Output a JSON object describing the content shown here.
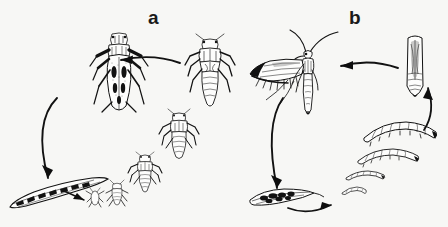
{
  "figure": {
    "background_color": "#f7f7f5",
    "ink_color": "#121212",
    "width": 448,
    "height": 227,
    "style": "black-and-white line drawing"
  },
  "panels": [
    {
      "id": "a",
      "label": "a",
      "label_position": {
        "x": 148,
        "y": 8
      },
      "subject": "leafhopper life cycle",
      "cycle_direction": "counter-clockwise",
      "stages": [
        {
          "name": "adult",
          "order": 5,
          "data_name": "leafhopper-adult",
          "description": "winged adult leafhopper, dorsal view, dark markings on forewings",
          "position": {
            "x": 88,
            "y": 75
          },
          "size": {
            "w": 62,
            "h": 86
          }
        },
        {
          "name": "fifth-instar-nymph",
          "order": 4,
          "data_name": "leafhopper-nymph-5",
          "description": "largest nymph with wing pads",
          "position": {
            "x": 203,
            "y": 72
          },
          "size": {
            "w": 52,
            "h": 78
          }
        },
        {
          "name": "fourth-instar-nymph",
          "order": 3,
          "data_name": "leafhopper-nymph-4",
          "description": "medium nymph",
          "position": {
            "x": 173,
            "y": 128
          },
          "size": {
            "w": 40,
            "h": 58
          }
        },
        {
          "name": "third-instar-nymph",
          "order": 2,
          "data_name": "leafhopper-nymph-3",
          "description": "small nymph",
          "position": {
            "x": 143,
            "y": 170
          },
          "size": {
            "w": 33,
            "h": 48
          }
        },
        {
          "name": "first-instar-nymph",
          "order": 1,
          "data_name": "leafhopper-nymph-1",
          "description": "tiny newly hatched nymphs",
          "position": {
            "x": 112,
            "y": 192
          },
          "size": {
            "w": 22,
            "h": 26
          }
        },
        {
          "name": "eggs-in-plant-tissue",
          "order": 0,
          "data_name": "leafhopper-eggs",
          "description": "eggs inserted in a leaf midrib / stem, curved blade shape",
          "position": {
            "x": 10,
            "y": 178
          },
          "size": {
            "w": 100,
            "h": 36
          }
        }
      ],
      "arrows": [
        {
          "data_name": "arrow-nymph-to-adult",
          "from": "fifth-instar-nymph",
          "to": "adult",
          "direction": "leftward",
          "curve": "arc-up"
        },
        {
          "data_name": "arrow-adult-to-eggs",
          "from": "adult",
          "to": "eggs-in-plant-tissue",
          "direction": "downward-left",
          "curve": "arc-left"
        },
        {
          "data_name": "arrow-eggs-to-nymph",
          "from": "eggs-in-plant-tissue",
          "to": "first-instar-nymph",
          "direction": "rightward-down",
          "curve": "straight"
        }
      ]
    },
    {
      "id": "b",
      "label": "b",
      "label_position": {
        "x": 349,
        "y": 8
      },
      "subject": "moth life cycle",
      "cycle_direction": "counter-clockwise",
      "stages": [
        {
          "name": "adult-moth",
          "order": 5,
          "data_name": "moth-adult",
          "description": "adult moth at rest, long antennae, narrow fringed forewings",
          "position": {
            "x": 258,
            "y": 32
          },
          "size": {
            "w": 96,
            "h": 92
          }
        },
        {
          "name": "pupa",
          "order": 4,
          "data_name": "moth-pupa",
          "description": "pupa in silken cocoon, upright",
          "position": {
            "x": 405,
            "y": 34
          },
          "size": {
            "w": 24,
            "h": 70
          }
        },
        {
          "name": "fourth-instar-larva",
          "order": 3,
          "data_name": "moth-larva-4",
          "description": "largest caterpillar, curved, segmented",
          "position": {
            "x": 364,
            "y": 126
          },
          "size": {
            "w": 76,
            "h": 22
          }
        },
        {
          "name": "third-instar-larva",
          "order": 2,
          "data_name": "moth-larva-3",
          "description": "medium caterpillar",
          "position": {
            "x": 357,
            "y": 152
          },
          "size": {
            "w": 62,
            "h": 18
          }
        },
        {
          "name": "second-instar-larva",
          "order": 1,
          "data_name": "moth-larva-2",
          "description": "small caterpillar",
          "position": {
            "x": 345,
            "y": 174
          },
          "size": {
            "w": 40,
            "h": 12
          }
        },
        {
          "name": "first-instar-larva",
          "order": 0,
          "data_name": "moth-larva-1",
          "description": "tiny newly hatched caterpillar",
          "position": {
            "x": 341,
            "y": 190
          },
          "size": {
            "w": 26,
            "h": 10
          }
        },
        {
          "name": "eggs-on-leaf",
          "order": -1,
          "data_name": "moth-eggs",
          "description": "cluster of eggs laid on a narrow leaf",
          "position": {
            "x": 250,
            "y": 188
          },
          "size": {
            "w": 68,
            "h": 26
          }
        }
      ],
      "arrows": [
        {
          "data_name": "arrow-pupa-to-moth",
          "from": "pupa",
          "to": "adult-moth",
          "direction": "leftward",
          "curve": "arc-up"
        },
        {
          "data_name": "arrow-moth-to-eggs",
          "from": "adult-moth",
          "to": "eggs-on-leaf",
          "direction": "downward-left",
          "curve": "arc-left"
        },
        {
          "data_name": "arrow-eggs-to-larva",
          "from": "eggs-on-leaf",
          "to": "first-instar-larva",
          "direction": "rightward",
          "curve": "arc-down"
        },
        {
          "data_name": "arrow-larva-to-pupa",
          "from": "fourth-instar-larva",
          "to": "pupa",
          "direction": "upward",
          "curve": "arc-right"
        }
      ]
    }
  ]
}
